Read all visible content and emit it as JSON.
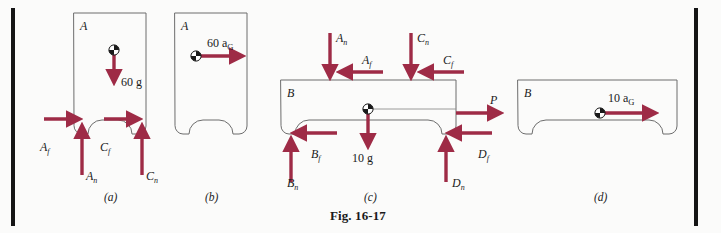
{
  "figure": {
    "caption": "Fig. 16-17",
    "accent_color": "#9e2b46",
    "outline_color": "#6d6d6d",
    "background_color": "#fbfbfa",
    "rule_color": "#151515"
  },
  "panels": [
    {
      "id": "a",
      "sublabel": "(a)",
      "body_label": "A",
      "type": "free-body-diagram",
      "forces": [
        {
          "name": "60 g",
          "label": "60 g",
          "direction": "down",
          "kind": "weight"
        },
        {
          "name": "A_f",
          "label": "A",
          "sub": "f",
          "direction": "right",
          "kind": "friction"
        },
        {
          "name": "A_n",
          "label": "A",
          "sub": "n",
          "direction": "up",
          "kind": "normal"
        },
        {
          "name": "C_f",
          "label": "C",
          "sub": "f",
          "direction": "right",
          "kind": "friction"
        },
        {
          "name": "C_n",
          "label": "C",
          "sub": "n",
          "direction": "up",
          "kind": "normal"
        }
      ]
    },
    {
      "id": "b",
      "sublabel": "(b)",
      "body_label": "A",
      "type": "kinetic-diagram",
      "forces": [
        {
          "name": "60 aG",
          "label": "60 a",
          "sub": "G",
          "direction": "right",
          "kind": "inertia"
        }
      ]
    },
    {
      "id": "c",
      "sublabel": "(c)",
      "body_label": "B",
      "type": "free-body-diagram",
      "forces": [
        {
          "name": "A_n",
          "label": "A",
          "sub": "n",
          "direction": "down",
          "kind": "normal"
        },
        {
          "name": "A_f",
          "label": "A",
          "sub": "f",
          "direction": "left",
          "kind": "friction"
        },
        {
          "name": "C_n",
          "label": "C",
          "sub": "n",
          "direction": "down",
          "kind": "normal"
        },
        {
          "name": "C_f",
          "label": "C",
          "sub": "f",
          "direction": "left",
          "kind": "friction"
        },
        {
          "name": "P",
          "label": "P",
          "direction": "right",
          "kind": "applied"
        },
        {
          "name": "10 g",
          "label": "10 g",
          "direction": "down",
          "kind": "weight"
        },
        {
          "name": "B_f",
          "label": "B",
          "sub": "f",
          "direction": "left",
          "kind": "friction"
        },
        {
          "name": "B_n",
          "label": "B",
          "sub": "n",
          "direction": "up",
          "kind": "normal"
        },
        {
          "name": "D_f",
          "label": "D",
          "sub": "f",
          "direction": "left",
          "kind": "friction"
        },
        {
          "name": "D_n",
          "label": "D",
          "sub": "n",
          "direction": "up",
          "kind": "normal"
        }
      ]
    },
    {
      "id": "d",
      "sublabel": "(d)",
      "body_label": "B",
      "type": "kinetic-diagram",
      "forces": [
        {
          "name": "10 aG",
          "label": "10 a",
          "sub": "G",
          "direction": "right",
          "kind": "inertia"
        }
      ]
    }
  ]
}
